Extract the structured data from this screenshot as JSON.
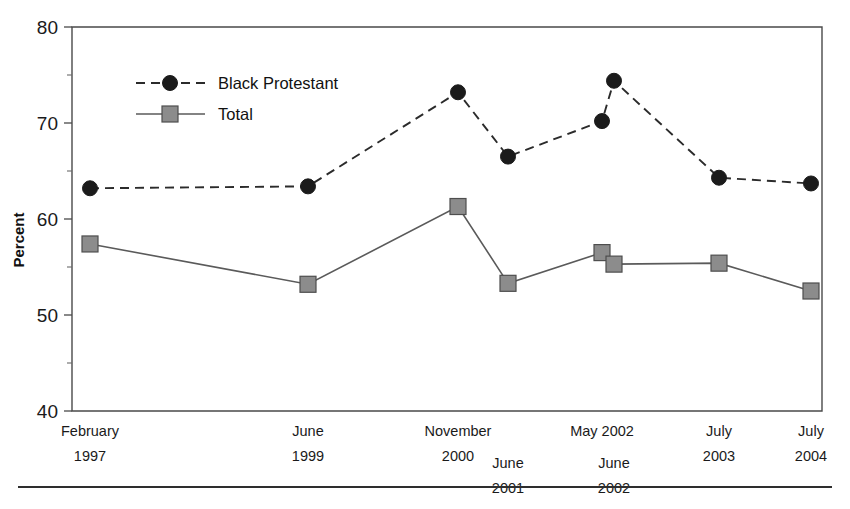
{
  "chart_data": {
    "type": "line",
    "title": "",
    "subtitle": "",
    "xlabel": "",
    "ylabel": "Percent",
    "ylim": [
      40,
      80
    ],
    "grid": false,
    "legend_position": "upper-left-inside",
    "categories": [
      "February 1997",
      "June 1999",
      "November 2000",
      "June 2001",
      "May 2002",
      "June 2002",
      "July 2003",
      "July 2004"
    ],
    "x_tick_labels": [
      {
        "line1": "February",
        "line2": "1997",
        "row": 0
      },
      {
        "line1": "June",
        "line2": "1999",
        "row": 0
      },
      {
        "line1": "November",
        "line2": "2000",
        "row": 0
      },
      {
        "line1": "June",
        "line2": "2001",
        "row": 1
      },
      {
        "line1": "May 2002",
        "line2": "",
        "row": 0
      },
      {
        "line1": "June",
        "line2": "2002",
        "row": 1
      },
      {
        "line1": "July",
        "line2": "2003",
        "row": 0
      },
      {
        "line1": "July",
        "line2": "2004",
        "row": 0
      }
    ],
    "y_ticks_major": [
      40,
      50,
      60,
      70,
      80
    ],
    "y_ticks_minor": [
      45,
      55,
      65,
      75
    ],
    "series": [
      {
        "name": "Black Protestant",
        "marker": "circle",
        "line": "dashed",
        "color": "#1b1b1b",
        "values": [
          63.2,
          63.4,
          73.2,
          66.5,
          70.2,
          74.4,
          64.3,
          63.7
        ]
      },
      {
        "name": "Total",
        "marker": "square",
        "line": "solid",
        "color": "#8c8c8c",
        "values": [
          57.4,
          53.2,
          61.3,
          53.3,
          56.5,
          55.3,
          55.4,
          52.5
        ]
      }
    ]
  },
  "legend": {
    "entries": [
      {
        "label": "Black Protestant"
      },
      {
        "label": "Total"
      }
    ]
  },
  "colors": {
    "series_black": "#1b1b1b",
    "series_gray": "#8c8c8c",
    "axis": "#4a4a4a",
    "background": "#ffffff"
  }
}
